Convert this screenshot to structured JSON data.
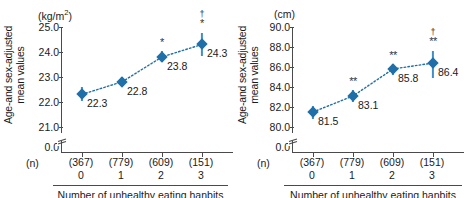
{
  "figure": {
    "ylabel_line1": "Age-and sex-adjusted",
    "ylabel_line2": "mean values",
    "xcaption": "Number of unhealthy eating hanbits",
    "n_prefix": "(n)",
    "accent_marker": "#1f6fa8",
    "accent_errorbar": "#3f8fc4"
  },
  "chart_data": [
    {
      "type": "line",
      "panel": "left",
      "title": "",
      "unit": "(kg/m²)",
      "ylabel": "Age-and sex-adjusted mean values",
      "xlabel": "Number of unhealthy eating hanbits",
      "categories": [
        "0",
        "1",
        "2",
        "3"
      ],
      "n_values": [
        "(367)",
        "(779)",
        "(609)",
        "(151)"
      ],
      "values": [
        22.3,
        22.8,
        23.8,
        24.3
      ],
      "data_labels": [
        "22.3",
        "22.8",
        "23.8",
        "24.3"
      ],
      "err_low": [
        22.05,
        22.62,
        23.6,
        23.85
      ],
      "err_high": [
        22.58,
        23.0,
        24.05,
        24.75
      ],
      "significance": [
        "",
        "",
        "*",
        "†*"
      ],
      "yticks": [
        21.0,
        22.0,
        23.0,
        24.0,
        25.0
      ],
      "ytick_labels": [
        "21.0",
        "22.0",
        "23.0",
        "24.0",
        "25.0"
      ],
      "ylim": [
        20.75,
        25.0
      ],
      "zero_label": "0.0",
      "axis_break": true,
      "grid": false,
      "legend": "none"
    },
    {
      "type": "line",
      "panel": "right",
      "title": "",
      "unit": "(cm)",
      "ylabel": "Age-and sex-adjusted mean values",
      "xlabel": "Number of unhealthy eating hanbits",
      "categories": [
        "0",
        "1",
        "2",
        "3"
      ],
      "n_values": [
        "(367)",
        "(779)",
        "(609)",
        "(151)"
      ],
      "values": [
        81.5,
        83.1,
        85.8,
        86.4
      ],
      "data_labels": [
        "81.5",
        "83.1",
        "85.8",
        "86.4"
      ],
      "err_low": [
        80.85,
        82.5,
        85.25,
        84.9
      ],
      "err_high": [
        82.1,
        83.7,
        86.35,
        87.6
      ],
      "significance": [
        "",
        "**",
        "**",
        "†**"
      ],
      "yticks": [
        80.0,
        82.0,
        84.0,
        86.0,
        88.0,
        90.0
      ],
      "ytick_labels": [
        "80.0",
        "82.0",
        "84.0",
        "86.0",
        "88.0",
        "90.0"
      ],
      "ylim": [
        79.4,
        90.0
      ],
      "zero_label": "0.0",
      "axis_break": true,
      "grid": false,
      "legend": "none"
    }
  ]
}
